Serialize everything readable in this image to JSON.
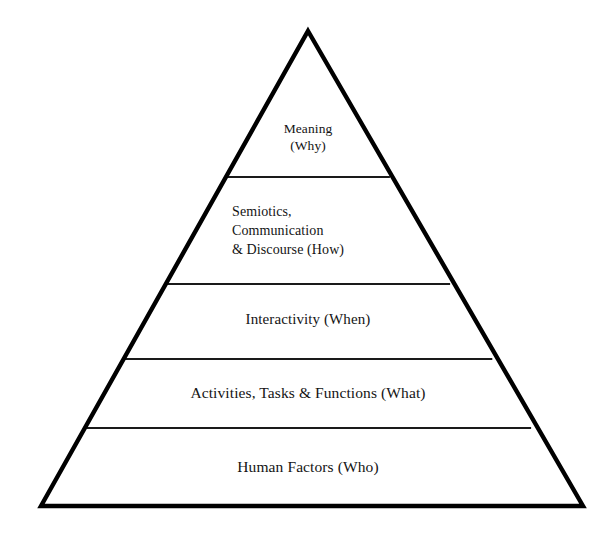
{
  "diagram": {
    "type": "pyramid",
    "orientation": "apex-up",
    "tier_count": 5,
    "background_color": "#ffffff",
    "outline_color": "#000000",
    "divider_color": "#1a1a1a",
    "tiers": [
      {
        "index": 1,
        "position": "apex",
        "label": "Meaning\n(Why)",
        "question_word": "Why",
        "align": "center"
      },
      {
        "index": 2,
        "position": "upper-middle",
        "label": "Semiotics,\nCommunication\n& Discourse (How)",
        "question_word": "How",
        "align": "left"
      },
      {
        "index": 3,
        "position": "middle",
        "label": "Interactivity (When)",
        "question_word": "When",
        "align": "center"
      },
      {
        "index": 4,
        "position": "lower-middle",
        "label": "Activities, Tasks & Functions (What)",
        "question_word": "What",
        "align": "center"
      },
      {
        "index": 5,
        "position": "base",
        "label": "Human Factors (Who)",
        "question_word": "Who",
        "align": "center"
      }
    ],
    "geometry": {
      "apex": [
        308,
        31
      ],
      "base_left": [
        41,
        506
      ],
      "base_right": [
        583,
        506
      ],
      "divider_y": [
        177,
        284,
        359,
        428
      ],
      "outline_width": 4,
      "divider_width": 2
    }
  }
}
